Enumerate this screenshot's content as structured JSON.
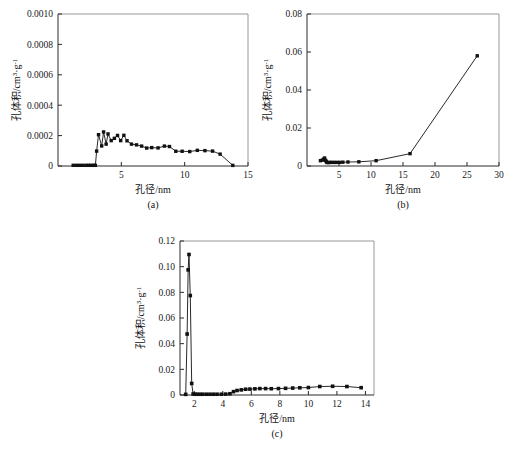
{
  "figure": {
    "name": "pore-size-distribution-figure",
    "axis_titles": {
      "x": "孔径/nm",
      "y_main": "孔体积/cm",
      "y_sup1": "3",
      "y_mid": "·g",
      "y_sup2": "-1"
    }
  },
  "chart_data": [
    {
      "type": "line",
      "panel": "a",
      "caption": "(a)",
      "title": "",
      "xlabel": "孔径/nm",
      "ylabel": "孔体积/cm3·g-1",
      "xlim": [
        0,
        15
      ],
      "ylim": [
        0,
        0.001
      ],
      "xticks": [
        5,
        10,
        15
      ],
      "yticks": [
        0,
        0.0002,
        0.0004,
        0.0006,
        0.0008,
        0.001
      ],
      "xticklabels": [
        "5",
        "10",
        "15"
      ],
      "yticklabels": [
        "0",
        "0.0002",
        "0.0004",
        "0.0006",
        "0.0008",
        "0.0010"
      ],
      "grid": false,
      "legend": "none",
      "x": [
        1.2,
        1.45,
        1.7,
        1.95,
        2.2,
        2.4,
        2.6,
        2.8,
        2.95,
        3.05,
        3.2,
        3.45,
        3.6,
        3.8,
        3.95,
        4.2,
        4.45,
        4.7,
        4.95,
        5.2,
        5.45,
        5.8,
        6.2,
        6.6,
        7.0,
        7.4,
        7.9,
        8.4,
        8.8,
        9.3,
        9.8,
        10.4,
        11.0,
        11.6,
        12.2,
        12.8,
        13.8
      ],
      "y": [
        4.5e-06,
        4.5e-06,
        4.5e-06,
        4.5e-06,
        4.5e-06,
        4.5e-06,
        4.5e-06,
        4.5e-06,
        4.5e-06,
        9.8e-05,
        0.000206,
        0.000132,
        0.000224,
        0.000144,
        0.000211,
        0.000167,
        0.000182,
        0.000201,
        0.000167,
        0.000202,
        0.000166,
        0.000144,
        0.000139,
        0.000131,
        0.000118,
        0.000121,
        0.000119,
        0.000131,
        0.000128,
        9.7e-05,
        9.7e-05,
        9.5e-05,
        0.000103,
        0.000101,
        9.8e-05,
        7.8e-05,
        4e-06
      ]
    },
    {
      "type": "line",
      "panel": "b",
      "caption": "(b)",
      "title": "",
      "xlabel": "孔径/nm",
      "ylabel": "孔体积/cm3·g-1",
      "xlim": [
        0,
        30
      ],
      "ylim": [
        0,
        0.08
      ],
      "xticks": [
        5,
        10,
        15,
        20,
        25,
        30
      ],
      "yticks": [
        0,
        0.02,
        0.04,
        0.06,
        0.08
      ],
      "xticklabels": [
        "5",
        "10",
        "15",
        "20",
        "25",
        "30"
      ],
      "yticklabels": [
        "0",
        "0.02",
        "0.04",
        "0.06",
        "0.08"
      ],
      "grid": false,
      "legend": "none",
      "x": [
        2.1,
        2.4,
        2.6,
        2.75,
        2.9,
        3.0,
        3.1,
        3.3,
        3.6,
        3.9,
        4.3,
        4.7,
        5.1,
        5.6,
        6.4,
        8.1,
        10.8,
        16.1,
        26.6
      ],
      "y": [
        0.0028,
        0.0031,
        0.0036,
        0.0042,
        0.003,
        0.0024,
        0.0019,
        0.0018,
        0.0019,
        0.0019,
        0.0019,
        0.0019,
        0.0019,
        0.002,
        0.0021,
        0.0022,
        0.0028,
        0.0065,
        0.058
      ]
    },
    {
      "type": "line",
      "panel": "c",
      "caption": "(c)",
      "title": "",
      "xlabel": "孔径/nm",
      "ylabel": "孔体积/cm3·g-1",
      "xlim": [
        1,
        14.6
      ],
      "ylim": [
        0,
        0.12
      ],
      "xticks": [
        2,
        4,
        6,
        8,
        10,
        12,
        14
      ],
      "yticks": [
        0,
        0.02,
        0.04,
        0.06,
        0.08,
        0.1,
        0.12
      ],
      "xticklabels": [
        "2",
        "4",
        "6",
        "8",
        "10",
        "12",
        "14"
      ],
      "yticklabels": [
        "0",
        "0.02",
        "0.04",
        "0.06",
        "0.08",
        "0.10",
        "0.12"
      ],
      "grid": false,
      "legend": "none",
      "x": [
        1.4,
        1.5,
        1.57,
        1.63,
        1.72,
        1.82,
        1.92,
        2.05,
        2.2,
        2.4,
        2.6,
        2.85,
        3.1,
        3.35,
        3.6,
        3.9,
        4.2,
        4.5,
        4.75,
        5.0,
        5.3,
        5.6,
        5.9,
        6.25,
        6.6,
        7.0,
        7.4,
        7.9,
        8.4,
        8.9,
        9.4,
        10.0,
        10.8,
        11.7,
        12.7,
        13.7
      ],
      "y": [
        0.0005,
        0.0475,
        0.0975,
        0.1095,
        0.0775,
        0.009,
        0.0008,
        0.0006,
        0.0006,
        0.0006,
        0.0006,
        0.0006,
        0.0006,
        0.0006,
        0.0006,
        0.0006,
        0.0007,
        0.001,
        0.0026,
        0.0035,
        0.004,
        0.0045,
        0.0046,
        0.0048,
        0.005,
        0.005,
        0.0049,
        0.005,
        0.0052,
        0.0054,
        0.0056,
        0.0058,
        0.0066,
        0.0068,
        0.0066,
        0.0057
      ]
    }
  ]
}
